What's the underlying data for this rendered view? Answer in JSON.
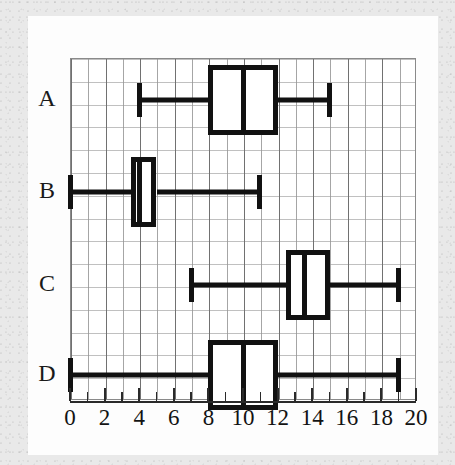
{
  "figure": {
    "kind": "box-and-whisker-plot",
    "background_color": "#e9e9e9",
    "paper_color": "#fdfdfd",
    "ink_color": "#111111",
    "grid_color": "#969696"
  },
  "chart_data": {
    "type": "box",
    "orientation": "horizontal",
    "title": "",
    "xlabel": "",
    "ylabel": "",
    "xlim": [
      0,
      20
    ],
    "grid": true,
    "legend": "none",
    "categories": [
      "A",
      "B",
      "C",
      "D"
    ],
    "xticks": [
      0,
      2,
      4,
      6,
      8,
      10,
      12,
      14,
      16,
      18,
      20
    ],
    "xtick_labels": [
      "0",
      "2",
      "4",
      "6",
      "8",
      "10",
      "12",
      "14",
      "16",
      "18",
      "20"
    ],
    "xtick_step_minor": 1,
    "series": [
      {
        "name": "A",
        "min": 4,
        "q1": 8,
        "median": 10,
        "q3": 12,
        "max": 15
      },
      {
        "name": "B",
        "min": 0,
        "q1": 3.5,
        "median": 4,
        "q3": 5,
        "max": 11
      },
      {
        "name": "C",
        "min": 7,
        "q1": 12.5,
        "median": 13.5,
        "q3": 15,
        "max": 19
      },
      {
        "name": "D",
        "min": 0,
        "q1": 8,
        "median": 10,
        "q3": 12,
        "max": 19
      }
    ]
  }
}
